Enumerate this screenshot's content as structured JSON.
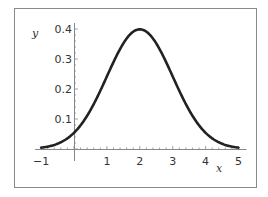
{
  "chart_data": {
    "type": "line",
    "title": "",
    "xlabel": "x",
    "ylabel": "y",
    "xlim": [
      -1,
      5
    ],
    "ylim": [
      0,
      0.4
    ],
    "grid": false,
    "legend": null,
    "x_ticks": [
      "-1",
      "1",
      "2",
      "3",
      "4",
      "5"
    ],
    "y_ticks": [
      "0.1",
      "0.2",
      "0.3",
      "0.4"
    ],
    "series": [
      {
        "name": "Normal density (mean 2, sd 1)",
        "x": [
          -1,
          -0.5,
          0,
          0.5,
          1,
          1.5,
          2,
          2.5,
          3,
          3.5,
          4,
          4.5,
          5
        ],
        "values": [
          0.004,
          0.018,
          0.054,
          0.13,
          0.242,
          0.352,
          0.399,
          0.352,
          0.242,
          0.13,
          0.054,
          0.018,
          0.004
        ]
      }
    ],
    "colors": {
      "curve": "#222222",
      "axes": "#888888",
      "frame": "#888888"
    }
  }
}
